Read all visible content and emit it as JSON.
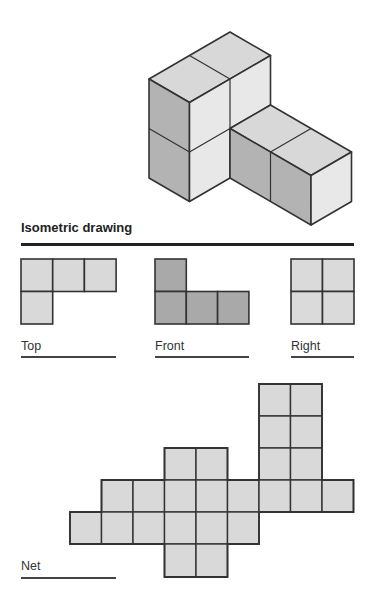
{
  "labels": {
    "isometric": "Isometric drawing",
    "top": "Top",
    "front": "Front",
    "right": "Right",
    "net": "Net"
  },
  "colors": {
    "top_face": "#d8d8d8",
    "left_face": "#b3b3b3",
    "right_face": "#e8e8e8",
    "front_view": "#a9a9a9",
    "light_view": "#d9d9d9",
    "stroke": "#333333"
  },
  "views": {
    "top": {
      "cols": 3,
      "rows": 2,
      "cells": [
        [
          0,
          0
        ],
        [
          1,
          0
        ],
        [
          2,
          0
        ],
        [
          0,
          1
        ]
      ]
    },
    "front": {
      "cols": 3,
      "rows": 2,
      "cells": [
        [
          0,
          0
        ],
        [
          0,
          1
        ],
        [
          1,
          1
        ],
        [
          2,
          1
        ]
      ]
    },
    "right": {
      "cols": 2,
      "rows": 2,
      "cells": [
        [
          0,
          0
        ],
        [
          1,
          0
        ],
        [
          0,
          1
        ],
        [
          1,
          1
        ]
      ]
    }
  },
  "net": {
    "cells": [
      [
        6,
        0
      ],
      [
        7,
        0
      ],
      [
        6,
        1
      ],
      [
        7,
        1
      ],
      [
        3,
        2
      ],
      [
        4,
        2
      ],
      [
        6,
        2
      ],
      [
        7,
        2
      ],
      [
        1,
        3
      ],
      [
        2,
        3
      ],
      [
        3,
        3
      ],
      [
        4,
        3
      ],
      [
        5,
        3
      ],
      [
        6,
        3
      ],
      [
        7,
        3
      ],
      [
        8,
        3
      ],
      [
        0,
        4
      ],
      [
        1,
        4
      ],
      [
        2,
        4
      ],
      [
        3,
        4
      ],
      [
        4,
        4
      ],
      [
        5,
        4
      ],
      [
        3,
        5
      ],
      [
        4,
        5
      ]
    ],
    "cell_count": 24
  },
  "solid": {
    "cube_count": 6
  }
}
